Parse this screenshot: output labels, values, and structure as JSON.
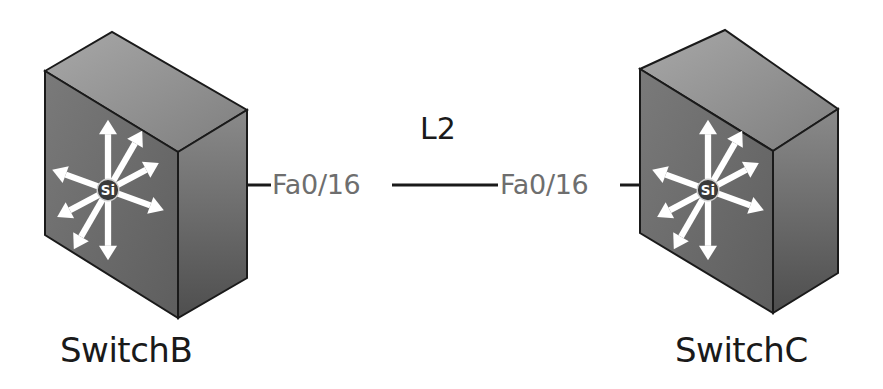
{
  "diagram": {
    "type": "network-topology",
    "devices": [
      {
        "id": "switchB",
        "label": "SwitchB",
        "icon": "multilayer-switch-icon",
        "badge": "Si"
      },
      {
        "id": "switchC",
        "label": "SwitchC",
        "icon": "multilayer-switch-icon",
        "badge": "Si"
      }
    ],
    "links": [
      {
        "label": "L2",
        "from": {
          "device": "SwitchB",
          "port": "Fa0/16"
        },
        "to": {
          "device": "SwitchC",
          "port": "Fa0/16"
        }
      }
    ],
    "colors": {
      "background": "#ffffff",
      "device_top": "#8c8c8c",
      "device_front": "#6a6a6a",
      "device_side": "#555555",
      "arrows": "#ffffff",
      "port_text": "#6e6e6e",
      "label_text": "#1a1a1a",
      "link_line": "#1a1a1a"
    }
  }
}
